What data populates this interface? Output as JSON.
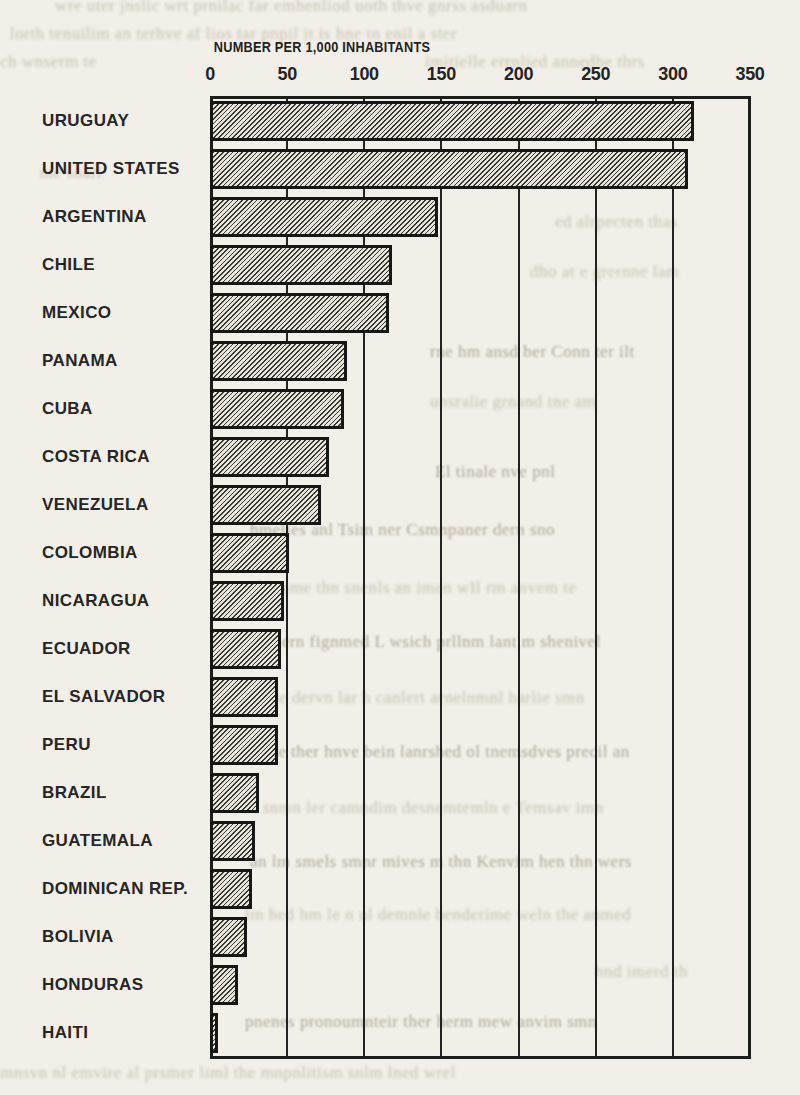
{
  "chart_data": {
    "type": "bar",
    "orientation": "horizontal",
    "title": "NUMBER PER 1,000 INHABITANTS",
    "categories": [
      "URUGUAY",
      "UNITED STATES",
      "ARGENTINA",
      "CHILE",
      "MEXICO",
      "PANAMA",
      "CUBA",
      "COSTA RICA",
      "VENEZUELA",
      "COLOMBIA",
      "NICARAGUA",
      "ECUADOR",
      "EL SALVADOR",
      "PERU",
      "BRAZIL",
      "GUATEMALA",
      "DOMINICAN REP.",
      "BOLIVIA",
      "HONDURAS",
      "HAITI"
    ],
    "values": [
      314,
      310,
      148,
      118,
      116,
      89,
      87,
      77,
      72,
      51,
      48,
      46,
      44,
      44,
      32,
      29,
      27,
      24,
      18,
      5
    ],
    "xlabel": "NUMBER PER 1,000 INHABITANTS",
    "ylabel": "",
    "xlim": [
      0,
      350
    ],
    "x_ticks": [
      0,
      50,
      100,
      150,
      200,
      250,
      300,
      350
    ],
    "x_tick_labels": [
      "0",
      "50",
      "100",
      "150",
      "200",
      "250",
      "300",
      "350"
    ],
    "grid": "vertical gridlines every 50, full chart height",
    "bar_style": "fine diagonal hatch, black outline",
    "legend": "none"
  },
  "caption": {
    "years": "1966-1967"
  },
  "colors": {
    "page_bg": "#f2efe8",
    "ink": "#1d1d1d",
    "bleed_text": "#c0baab"
  },
  "illegible_bleed_through_lines": [
    {
      "t": -4,
      "l": 55,
      "w": 740,
      "d": 0,
      "text": "wre uter jnslic wrt prnilac far emhenliod uoth thve gnrss asduarn"
    },
    {
      "t": 24,
      "l": 10,
      "w": 780,
      "d": 0,
      "text": "lorth tenuilim an terhve af lios tar pnpil it is hne tn enil a ster"
    },
    {
      "t": 52,
      "l": 0,
      "w": 195,
      "d": 0,
      "text": "ch wnserm te"
    },
    {
      "t": 52,
      "l": 425,
      "w": 375,
      "d": 0,
      "text": "imitielle errnlied annedhe thrs"
    },
    {
      "t": 112,
      "l": 590,
      "w": 205,
      "d": 0,
      "text": "selpnem es lic"
    },
    {
      "t": 163,
      "l": 40,
      "w": 130,
      "d": 0,
      "text": "me snarl"
    },
    {
      "t": 212,
      "l": 555,
      "w": 240,
      "d": 0,
      "text": "ed alrpecten thas"
    },
    {
      "t": 262,
      "l": 530,
      "w": 260,
      "d": 0,
      "text": "dho at e grernne lam"
    },
    {
      "t": 342,
      "l": 430,
      "w": 365,
      "d": 1,
      "text": "rne hm ansd ber Conn ter ilt"
    },
    {
      "t": 392,
      "l": 430,
      "w": 330,
      "d": 0,
      "text": "unsralie grnand tne am"
    },
    {
      "t": 462,
      "l": 435,
      "w": 360,
      "d": 1,
      "text": "El tinale nve pnl"
    },
    {
      "t": 520,
      "l": 250,
      "w": 545,
      "d": 1,
      "text": "hmelies anl Tsim ner Csmnpaner dern sno"
    },
    {
      "t": 578,
      "l": 250,
      "w": 540,
      "d": 0,
      "text": "slierame thn snenls an imen wIl rm anvem te"
    },
    {
      "t": 632,
      "l": 230,
      "w": 565,
      "d": 1,
      "text": "lne Ed ern fignmed L wsich prllnm lant m shenivel"
    },
    {
      "t": 688,
      "l": 245,
      "w": 550,
      "d": 0,
      "text": "rn the dervn lar h canlert arnelnmnl harlie smn"
    },
    {
      "t": 742,
      "l": 245,
      "w": 550,
      "d": 1,
      "text": "milve ther hnve bein lanrshed ol tnemsdves precil an"
    },
    {
      "t": 798,
      "l": 230,
      "w": 565,
      "d": 0,
      "text": "thm snmn ler camndim desnemtemln e Temsav imn"
    },
    {
      "t": 852,
      "l": 250,
      "w": 545,
      "d": 1,
      "text": "an lm smels smnr mives m thn Kenvim hen thn wers"
    },
    {
      "t": 905,
      "l": 245,
      "w": 530,
      "d": 0,
      "text": "lm hed hm le n ul demnle benderime weln the anmed"
    },
    {
      "t": 962,
      "l": 595,
      "w": 205,
      "d": 0,
      "text": "hnd imerd th"
    },
    {
      "t": 1012,
      "l": 245,
      "w": 550,
      "d": 1,
      "text": "pnenes pronoumnteir ther herm mew anvim smn"
    },
    {
      "t": 1063,
      "l": 0,
      "w": 800,
      "d": 0,
      "text": "mnsvn nl emvire al prsmer liml the mnpnlitism snlm lned wrel"
    }
  ]
}
